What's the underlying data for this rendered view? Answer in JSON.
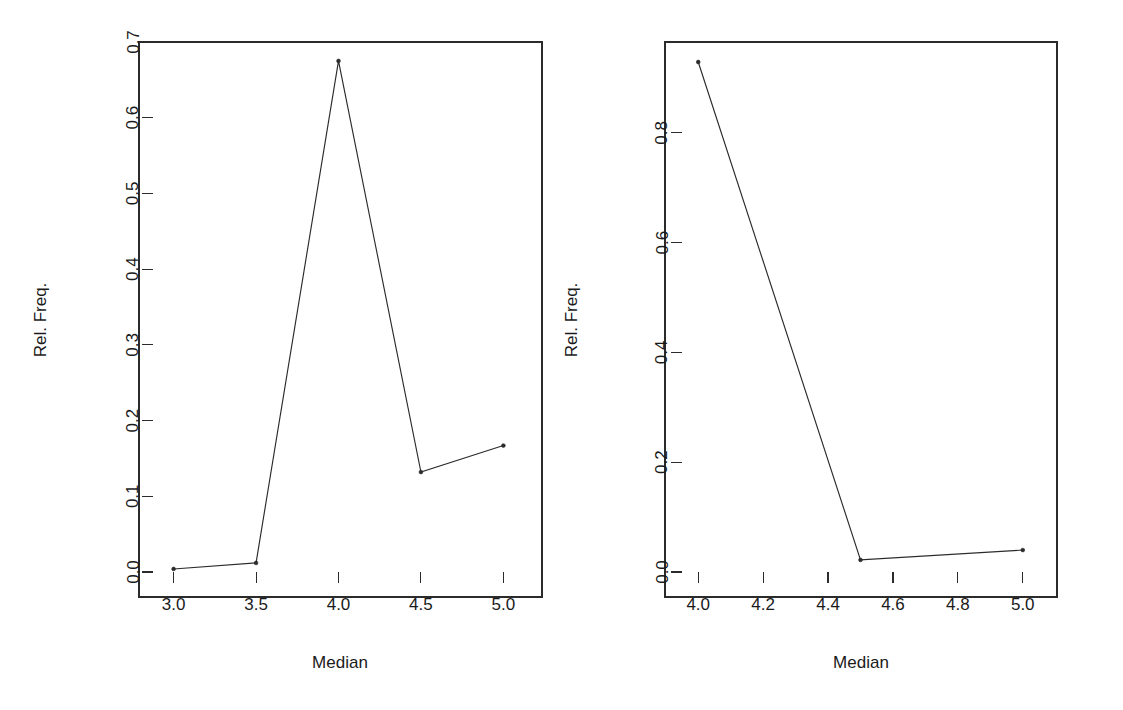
{
  "figure": {
    "background": "#ffffff",
    "line_color": "#2b2b2b",
    "text_color": "#1a1a1a",
    "panel_count": 2
  },
  "chart_data": [
    {
      "type": "line",
      "panel": "left",
      "title": "",
      "xlabel": "Median",
      "ylabel": "Rel. Freq.",
      "x": [
        3.0,
        3.5,
        4.0,
        4.5,
        5.0
      ],
      "values": [
        0.004,
        0.012,
        0.675,
        0.132,
        0.167
      ],
      "xlim": [
        2.875,
        5.125
      ],
      "ylim": [
        0.0,
        0.7
      ],
      "xticks": [
        3.0,
        3.5,
        4.0,
        4.5,
        5.0
      ],
      "xticklabels": [
        "3.0",
        "3.5",
        "4.0",
        "4.5",
        "5.0"
      ],
      "yticks": [
        0.0,
        0.1,
        0.2,
        0.3,
        0.4,
        0.5,
        0.6,
        0.7
      ],
      "yticklabels": [
        "0.0",
        "0.1",
        "0.2",
        "0.3",
        "0.4",
        "0.5",
        "0.6",
        "0.7"
      ],
      "grid": false,
      "legend": null,
      "marker": "point",
      "box": true
    },
    {
      "type": "line",
      "panel": "right",
      "title": "",
      "xlabel": "Median",
      "ylabel": "Rel. Freq.",
      "x": [
        4.0,
        4.5,
        5.0
      ],
      "values": [
        0.929,
        0.022,
        0.04
      ],
      "xlim": [
        3.95,
        5.05
      ],
      "ylim": [
        0.0,
        0.96
      ],
      "xticks": [
        4.0,
        4.2,
        4.4,
        4.6,
        4.8,
        5.0
      ],
      "xticklabels": [
        "4.0",
        "4.2",
        "4.4",
        "4.6",
        "4.8",
        "5.0"
      ],
      "yticks": [
        0.0,
        0.2,
        0.4,
        0.6,
        0.8
      ],
      "yticklabels": [
        "0.0",
        "0.2",
        "0.4",
        "0.6",
        "0.8"
      ],
      "grid": false,
      "legend": null,
      "marker": "point",
      "box": true
    }
  ]
}
